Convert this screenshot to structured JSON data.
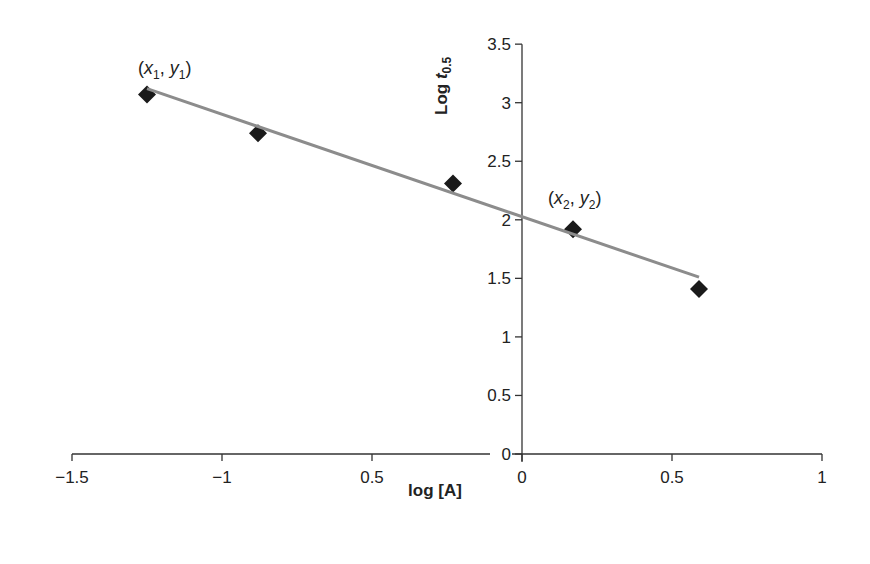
{
  "chart_data": {
    "type": "scatter",
    "title": "",
    "xlabel": "log [A]",
    "ylabel": "Log t0.5",
    "ylabel_parts": {
      "main": "Log ",
      "italic": "t",
      "sub": "0.5"
    },
    "xlim": [
      -1.5,
      1
    ],
    "ylim": [
      0,
      3.5
    ],
    "x_ticks": [
      -1.5,
      -1,
      -0.5,
      0,
      0.5,
      1
    ],
    "x_tick_labels": [
      "−1.5",
      "−1",
      "0.5",
      "0",
      "0.5",
      "1"
    ],
    "y_ticks": [
      0,
      0.5,
      1,
      1.5,
      2,
      2.5,
      3,
      3.5
    ],
    "y_tick_labels": [
      "0",
      "0.5",
      "1",
      "1.5",
      "2",
      "2.5",
      "3",
      "3.5"
    ],
    "grid": false,
    "legend": null,
    "series": [
      {
        "name": "data",
        "marker": "diamond",
        "color": "#1a1a1a",
        "x": [
          -1.25,
          -0.88,
          -0.23,
          0.17,
          0.59
        ],
        "y": [
          3.07,
          2.74,
          2.31,
          1.92,
          1.41
        ]
      },
      {
        "name": "linear fit",
        "type": "line",
        "color": "#8c8c8c",
        "x": [
          -1.25,
          0.59
        ],
        "y": [
          3.12,
          1.51
        ]
      }
    ],
    "annotations": [
      {
        "text": "(x1, y1)",
        "x": -1.25,
        "y": 3.07
      },
      {
        "text": "(x2, y2)",
        "x": 0.17,
        "y": 1.92
      }
    ]
  },
  "labels": {
    "xlabel": "log [A]",
    "ylabel_main": "Log ",
    "ylabel_italic": "t",
    "ylabel_sub": "0.5",
    "annot1_x": "x",
    "annot1_xsub": "1",
    "annot1_y": "y",
    "annot1_ysub": "1",
    "annot2_x": "x",
    "annot2_xsub": "2",
    "annot2_y": "y",
    "annot2_ysub": "2"
  }
}
